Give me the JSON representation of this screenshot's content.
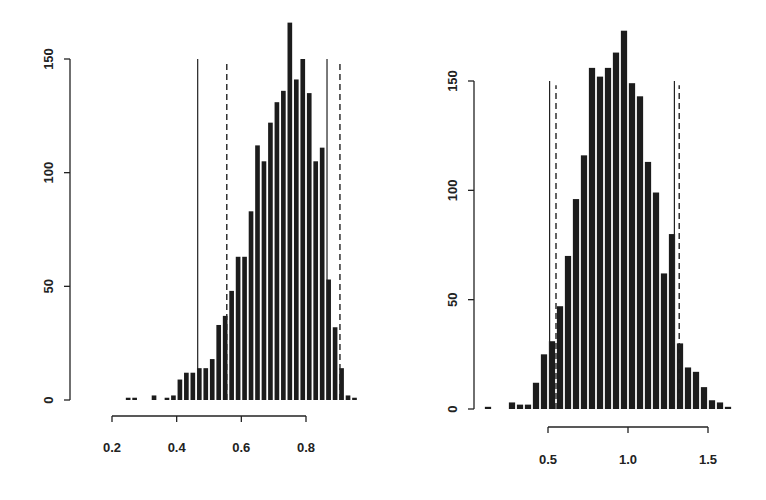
{
  "chart_data": [
    {
      "type": "bar",
      "title": "",
      "xlabel": "",
      "ylabel": "",
      "bin_width": 0.02,
      "x": [
        0.25,
        0.27,
        0.33,
        0.37,
        0.39,
        0.41,
        0.43,
        0.45,
        0.47,
        0.49,
        0.51,
        0.53,
        0.55,
        0.57,
        0.59,
        0.61,
        0.63,
        0.65,
        0.67,
        0.69,
        0.71,
        0.73,
        0.75,
        0.77,
        0.79,
        0.81,
        0.83,
        0.85,
        0.87,
        0.89,
        0.91,
        0.93,
        0.95
      ],
      "values": [
        1,
        1,
        2,
        1,
        2,
        9,
        12,
        12,
        14,
        14,
        18,
        33,
        37,
        48,
        63,
        63,
        83,
        112,
        105,
        122,
        131,
        136,
        166,
        141,
        150,
        135,
        105,
        111,
        53,
        32,
        14,
        2,
        1
      ],
      "xticks": [
        0.2,
        0.4,
        0.6,
        0.8
      ],
      "xtick_labels": [
        "0.2",
        "0.4",
        "0.6",
        "0.8"
      ],
      "yticks": [
        0,
        50,
        100,
        150
      ],
      "ytick_labels": [
        "0",
        "50",
        "100",
        "150"
      ],
      "xlim": [
        0.2,
        0.97
      ],
      "ylim": [
        0,
        150
      ],
      "grid": false,
      "vertical_lines": [
        {
          "x": 0.465,
          "style": "solid",
          "height": 150
        },
        {
          "x": 0.865,
          "style": "solid",
          "height": 150
        },
        {
          "x": 0.555,
          "style": "dashed",
          "height": 148
        },
        {
          "x": 0.905,
          "style": "dashed",
          "height": 148
        }
      ]
    },
    {
      "type": "bar",
      "title": "",
      "xlabel": "",
      "ylabel": "",
      "bin_width": 0.05,
      "x": [
        0.125,
        0.275,
        0.325,
        0.375,
        0.425,
        0.475,
        0.525,
        0.575,
        0.625,
        0.675,
        0.725,
        0.775,
        0.825,
        0.875,
        0.925,
        0.975,
        1.025,
        1.075,
        1.125,
        1.175,
        1.225,
        1.275,
        1.325,
        1.375,
        1.425,
        1.475,
        1.525,
        1.575,
        1.625
      ],
      "values": [
        1,
        3,
        2,
        2,
        12,
        25,
        31,
        47,
        70,
        96,
        116,
        156,
        152,
        156,
        163,
        173,
        149,
        143,
        113,
        99,
        62,
        80,
        30,
        19,
        17,
        10,
        4,
        3,
        1
      ],
      "xticks": [
        0.5,
        1.0,
        1.5
      ],
      "xtick_labels": [
        "0.5",
        "1.0",
        "1.5"
      ],
      "yticks": [
        0,
        50,
        100,
        150
      ],
      "ytick_labels": [
        "0",
        "50",
        "100",
        "150"
      ],
      "xlim": [
        0.1,
        1.65
      ],
      "ylim": [
        0,
        150
      ],
      "grid": false,
      "vertical_lines": [
        {
          "x": 0.51,
          "style": "solid",
          "height": 150
        },
        {
          "x": 1.29,
          "style": "solid",
          "height": 150
        },
        {
          "x": 0.55,
          "style": "dashed",
          "height": 148
        },
        {
          "x": 1.32,
          "style": "dashed",
          "height": 148
        }
      ]
    }
  ],
  "layout": {
    "panels": [
      {
        "y_axis_x": 70,
        "y0_px": 400,
        "y150_px": 59,
        "x_axis_y": 416,
        "xa": 0.2,
        "xa_px": 112,
        "xb": 0.8,
        "xb_px": 306,
        "label_y": 452,
        "bar_fill_ratio": 0.72
      },
      {
        "y_axis_x": 474,
        "y0_px": 409,
        "y150_px": 81,
        "x_axis_y": 427,
        "xa": 0.5,
        "xa_px": 548,
        "xb": 1.5,
        "xb_px": 708,
        "label_y": 464,
        "bar_fill_ratio": 0.78
      }
    ],
    "bar_color": "#1c1c1c",
    "line_color": "#222222"
  }
}
